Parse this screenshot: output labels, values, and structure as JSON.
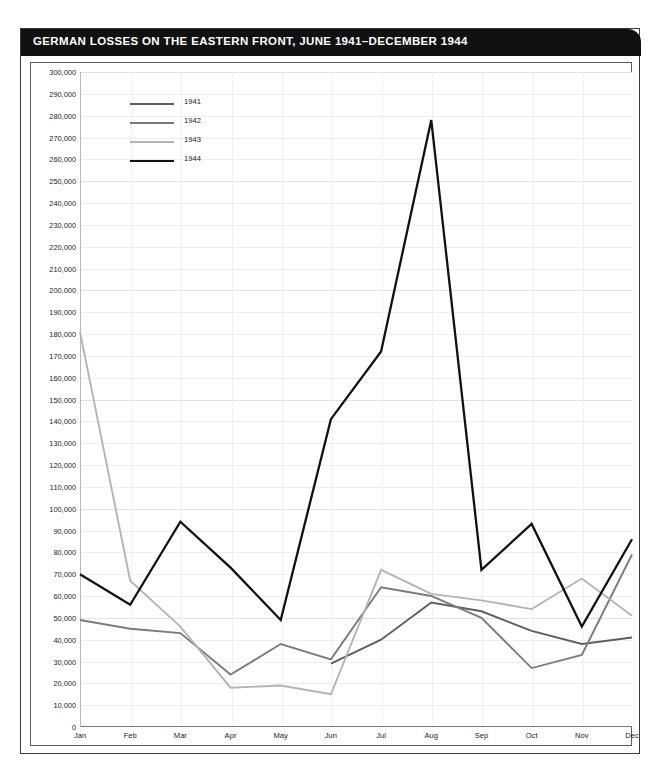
{
  "figure": {
    "title": "GERMAN LOSSES ON THE EASTERN FRONT, JUNE 1941–DECEMBER 1944",
    "title_bg": "#111111",
    "title_color": "#ffffff",
    "frame_color": "#3a3a3a"
  },
  "legend": {
    "position": "top-left-inside",
    "entries": [
      {
        "label": "1941",
        "color": "#5e5e5e"
      },
      {
        "label": "1942",
        "color": "#7b7b7b"
      },
      {
        "label": "1943",
        "color": "#b4b4b4"
      },
      {
        "label": "1944",
        "color": "#111111"
      }
    ]
  },
  "chart_data": {
    "type": "line",
    "title": "GERMAN LOSSES ON THE EASTERN FRONT, JUNE 1941–DECEMBER 1944",
    "xlabel": "",
    "ylabel": "",
    "grid": true,
    "ylim": [
      0,
      300000
    ],
    "ytick_step": 10000,
    "categories": [
      "Jan",
      "Feb",
      "Mar",
      "Apr",
      "May",
      "Jun",
      "Jul",
      "Aug",
      "Sep",
      "Oct",
      "Nov",
      "Dec"
    ],
    "ytick_labels": [
      "0",
      "10,000",
      "20,000",
      "30,000",
      "40,000",
      "50,000",
      "60,000",
      "70,000",
      "80,000",
      "90,000",
      "100,000",
      "110,000",
      "120,000",
      "130,000",
      "140,000",
      "150,000",
      "160,000",
      "170,000",
      "180,000",
      "190,000",
      "200,000",
      "210,000",
      "220,000",
      "230,000",
      "240,000",
      "250,000",
      "260,000",
      "270,000",
      "280,000",
      "290,000",
      "300,000"
    ],
    "series": [
      {
        "name": "1941",
        "color": "#5e5e5e",
        "values": [
          null,
          null,
          null,
          null,
          null,
          29000,
          40000,
          57000,
          53000,
          44000,
          38000,
          41000
        ]
      },
      {
        "name": "1942",
        "color": "#7b7b7b",
        "values": [
          49000,
          45000,
          43000,
          24000,
          38000,
          31000,
          64000,
          60000,
          50000,
          27000,
          33000,
          79000
        ]
      },
      {
        "name": "1943",
        "color": "#b4b4b4",
        "values": [
          181000,
          67000,
          46000,
          18000,
          19000,
          15000,
          72000,
          61000,
          58000,
          54000,
          68000,
          51000
        ]
      },
      {
        "name": "1944",
        "color": "#111111",
        "values": [
          70000,
          56000,
          94000,
          73000,
          49000,
          141000,
          172000,
          278000,
          72000,
          93000,
          46000,
          86000
        ]
      }
    ]
  }
}
